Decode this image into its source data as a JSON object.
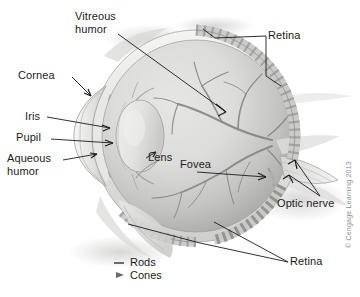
{
  "figure": {
    "background_color": "#ffffff",
    "credit": "© Cengage Learning 2013"
  },
  "labels": {
    "vitreous_humor_line1": "Vitreous",
    "vitreous_humor_line2": "humor",
    "cornea": "Cornea",
    "iris": "Iris",
    "pupil": "Pupil",
    "aqueous_humor_line1": "Aqueous",
    "aqueous_humor_line2": "humor",
    "lens": "Lens",
    "fovea": "Fovea",
    "retina_top": "Retina",
    "retina_bottom": "Retina",
    "optic_nerve": "Optic nerve"
  },
  "legend": {
    "items": [
      {
        "symbol": "rod-symbol",
        "label": "Rods"
      },
      {
        "symbol": "cone-symbol",
        "label": "Cones"
      }
    ]
  },
  "colors": {
    "interior": "#d9d9d7",
    "interior_shadow": "#a9a9a7",
    "sclera": "#ededeb",
    "retina_band": "#c6c6c4",
    "vessel": "#8e8e8c",
    "outline": "#6f6f6d",
    "leader": "#1b1b1b",
    "lens": "#e4e4e2",
    "text": "#1b1b1b",
    "credit_text": "#8f8f8f"
  },
  "structures": [
    {
      "name": "eyeball",
      "description": "large sphere forming globe of eye"
    },
    {
      "name": "cornea",
      "description": "transparent dome at front of eye"
    },
    {
      "name": "iris",
      "description": "pigmented ring surrounding pupil"
    },
    {
      "name": "pupil",
      "description": "central aperture of the iris"
    },
    {
      "name": "aqueous-humor",
      "description": "fluid in anterior chamber"
    },
    {
      "name": "lens",
      "description": "biconvex lens behind the iris"
    },
    {
      "name": "vitreous-humor",
      "description": "gel filling posterior cavity"
    },
    {
      "name": "retina",
      "description": "photoreceptor layer lining inner globe"
    },
    {
      "name": "fovea",
      "description": "central pit of sharpest vision"
    },
    {
      "name": "optic-nerve",
      "description": "nerve bundle exiting posterior eye"
    },
    {
      "name": "blood-vessels",
      "description": "retinal vasculature branching from optic disc"
    }
  ]
}
